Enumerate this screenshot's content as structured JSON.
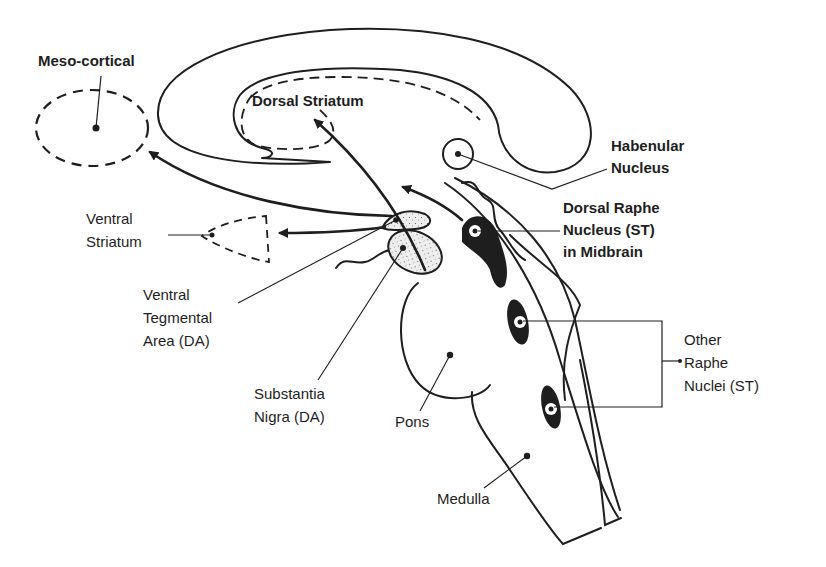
{
  "diagram": {
    "type": "neuroanatomy sagittal brain schematic",
    "colors": {
      "ink": "#1e1e1e",
      "background": "#ffffff",
      "stipple_fill": "#e8e8e8"
    },
    "labels": {
      "meso_cortical": "Meso-cortical",
      "dorsal_striatum": "Dorsal Striatum",
      "habenular_nucleus": "Habenular\nNucleus",
      "ventral_striatum": "Ventral\nStriatum",
      "dorsal_raphe": "Dorsal Raphe\nNucleus (ST)\nin Midbrain",
      "ventral_tegmental": "Ventral\nTegmental\nArea (DA)",
      "other_raphe": "Other\nRaphe\nNuclei (ST)",
      "substantia_nigra": "Substantia\nNigra (DA)",
      "pons": "Pons",
      "medulla": "Medulla"
    },
    "pathways": [
      {
        "from": "Ventral Tegmental Area (DA)",
        "to": "Meso-cortical"
      },
      {
        "from": "Ventral Tegmental Area (DA)",
        "to": "Ventral Striatum"
      },
      {
        "from": "Substantia Nigra (DA)",
        "to": "Dorsal Striatum"
      },
      {
        "from": "Dorsal Raphe Nucleus (ST)",
        "to": "Forebrain"
      }
    ]
  }
}
